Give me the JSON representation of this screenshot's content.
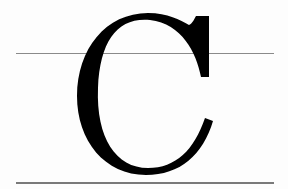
{
  "figure": {
    "glyph": "C",
    "glyph_color": "#000000",
    "guide_line_color": "#8a8a8a",
    "background": "#fdfdfd",
    "guide_lines": [
      {
        "name": "cap-or-x-height-line",
        "y": 53
      },
      {
        "name": "baseline",
        "y": 182
      }
    ]
  }
}
